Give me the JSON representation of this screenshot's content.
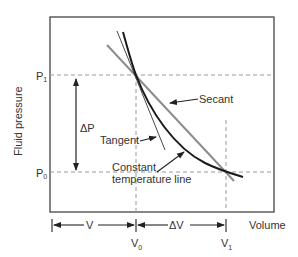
{
  "diagram": {
    "axes": {
      "y_label": "Fluid pressure",
      "x_label": "Volume"
    },
    "pressure_ticks": {
      "p1": "P",
      "p1_sub": "1",
      "p0": "P",
      "p0_sub": "0"
    },
    "volume_ticks": {
      "v0": "V",
      "v0_sub": "0",
      "v1": "V",
      "v1_sub": "1"
    },
    "dimensions": {
      "delta_p": "ΔP",
      "v": "V",
      "delta_v": "ΔV"
    },
    "annotations": {
      "secant": "Secant",
      "tangent": "Tangent",
      "constant_temp_line1": "Constant",
      "constant_temp_line2": "temperature line"
    },
    "colors": {
      "curve": "#1a1a1a",
      "secant": "#8c8c8c",
      "tangent": "#333333",
      "dashed_guides": "#9a9a9a",
      "frame": "#444444",
      "text": "#333333"
    }
  }
}
